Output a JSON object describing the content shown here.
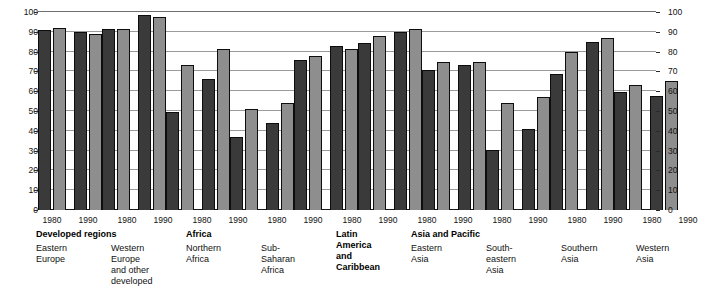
{
  "chart_data": {
    "type": "bar",
    "title": "",
    "xlabel": "",
    "ylabel": "",
    "ylim": [
      0,
      100
    ],
    "grid": true,
    "legend_position": "none",
    "y_ticks": [
      "100",
      "90",
      "80",
      "70",
      "60",
      "50",
      "40",
      "30",
      "20",
      "10",
      "0"
    ],
    "y_ticks_right": [
      "100",
      "90",
      "80",
      "70",
      "60",
      "50",
      "40",
      "30",
      "20",
      "10",
      "0"
    ],
    "year_categories": [
      "1980",
      "1990"
    ],
    "series": [
      {
        "name": "series-1",
        "color": "#3a3a3a"
      },
      {
        "name": "series-2",
        "color": "#8e8e8e"
      }
    ],
    "groups": [
      {
        "major": "Developed regions",
        "minor": "Eastern\nEurope",
        "years": [
          {
            "year": "1980",
            "values": [
              91,
              92
            ]
          },
          {
            "year": "1990",
            "values": [
              90,
              89
            ]
          }
        ]
      },
      {
        "major": "",
        "minor": "Western\nEurope\nand other\ndeveloped",
        "years": [
          {
            "year": "1980",
            "values": [
              91.5,
              91.5
            ]
          },
          {
            "year": "1990",
            "values": [
              98.5,
              97.5
            ]
          }
        ]
      },
      {
        "major": "Africa",
        "minor": "Northern\nAfrica",
        "years": [
          {
            "year": "1980",
            "values": [
              49.5,
              73
            ]
          },
          {
            "year": "1990",
            "values": [
              66,
              81.5
            ]
          }
        ]
      },
      {
        "major": "",
        "minor": "Sub-\nSaharan\nAfrica",
        "years": [
          {
            "year": "1980",
            "values": [
              37,
              51
            ]
          },
          {
            "year": "1990",
            "values": [
              44,
              54
            ]
          }
        ]
      },
      {
        "major": "Latin\nAmerica\nand\nCaribbean",
        "minor": "",
        "years": [
          {
            "year": "1980",
            "values": [
              76,
              78
            ]
          },
          {
            "year": "1990",
            "values": [
              83,
              81.5
            ]
          }
        ]
      },
      {
        "major": "Asia and Pacific",
        "minor": "Eastern\nAsia",
        "years": [
          {
            "year": "1980",
            "values": [
              84.5,
              88
            ]
          },
          {
            "year": "1990",
            "values": [
              90,
              91.5
            ]
          }
        ]
      },
      {
        "major": "",
        "minor": "South-\neastern\nAsia",
        "years": [
          {
            "year": "1980",
            "values": [
              70.5,
              75
            ]
          },
          {
            "year": "1990",
            "values": [
              73,
              75
            ]
          }
        ]
      },
      {
        "major": "",
        "minor": "Southern\nAsia",
        "years": [
          {
            "year": "1980",
            "values": [
              30.5,
              54
            ]
          },
          {
            "year": "1990",
            "values": [
              41,
              57
            ]
          }
        ]
      },
      {
        "major": "",
        "minor": "Western\nAsia",
        "years": [
          {
            "year": "1980",
            "values": [
              68.5,
              80
            ]
          },
          {
            "year": "1990",
            "values": [
              85,
              87
            ]
          }
        ]
      },
      {
        "major": "",
        "minor": "Oceania",
        "years": [
          {
            "year": "1980",
            "values": [
              59.5,
              63
            ]
          },
          {
            "year": "1990",
            "values": [
              57.5,
              65
            ]
          }
        ]
      }
    ]
  }
}
